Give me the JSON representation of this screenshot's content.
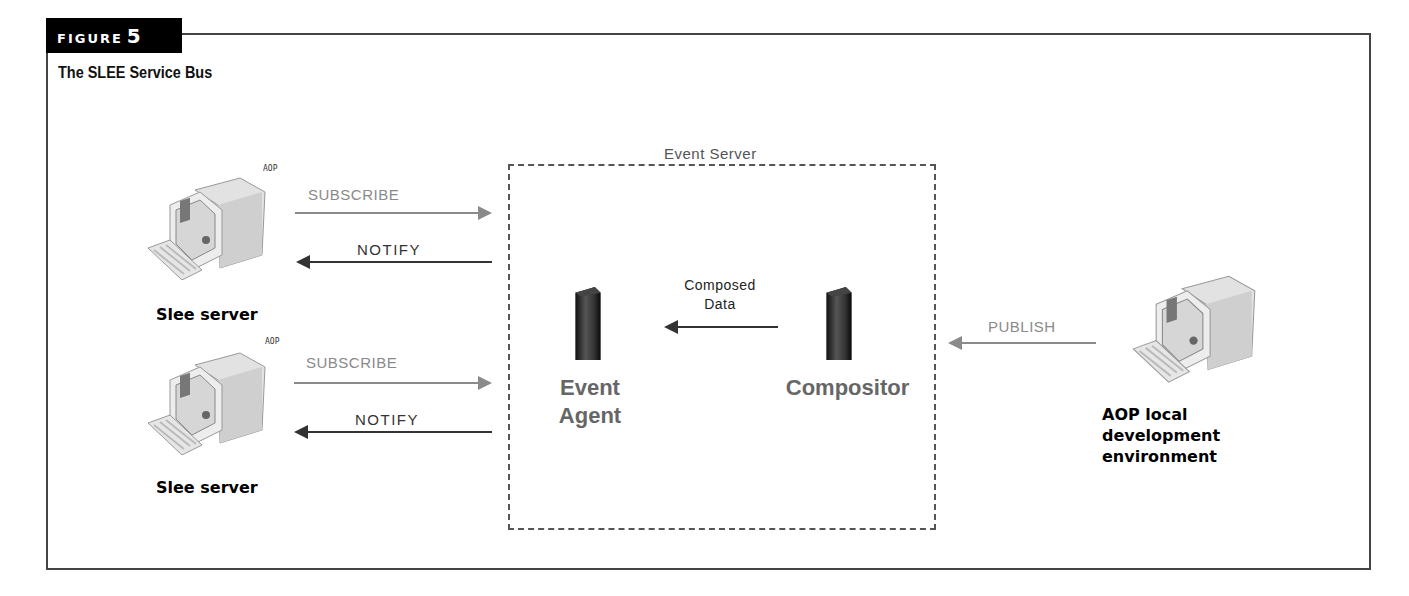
{
  "figure": {
    "tag_word": "FIGURE",
    "tag_number": "5",
    "title": "The SLEE Service Bus"
  },
  "event_server": {
    "label": "Event Server",
    "event_agent": {
      "line1": "Event",
      "line2": "Agent",
      "icon": "server-tower-icon"
    },
    "compositor": {
      "label": "Compositor",
      "icon": "server-tower-icon"
    },
    "internal_arrow": {
      "line1": "Composed",
      "line2": "Data",
      "direction": "compositor-to-event-agent"
    }
  },
  "slee_servers": [
    {
      "label": "Slee server",
      "badge": "AOP",
      "icon": "desktop-computer-icon",
      "subscribe_label": "SUBSCRIBE",
      "notify_label": "NOTIFY"
    },
    {
      "label": "Slee server",
      "badge": "AOP",
      "icon": "desktop-computer-icon",
      "subscribe_label": "SUBSCRIBE",
      "notify_label": "NOTIFY"
    }
  ],
  "aop_env": {
    "line1": "AOP local",
    "line2": "development",
    "line3": "environment",
    "icon": "desktop-computer-icon",
    "publish_label": "PUBLISH"
  },
  "colors": {
    "frame": "#444444",
    "tag_bg": "#000000",
    "gray_arrow": "#8a8a8a",
    "dark_arrow": "#333333",
    "component_label": "#666666"
  }
}
